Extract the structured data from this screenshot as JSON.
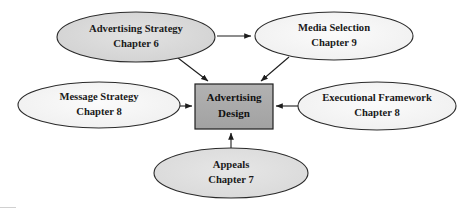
{
  "diagram": {
    "title": "Advertising Design",
    "type": "hub-and-spoke-flow",
    "canvas": {
      "width": 466,
      "height": 208,
      "background": "#ffffff"
    },
    "center": {
      "id": "advertising-design",
      "line1": "Advertising",
      "line2": "Design",
      "shape": "rectangle",
      "fill": "#a9a9a9",
      "stroke": "#1f1f1f",
      "x": 195,
      "y": 84,
      "width": 78,
      "height": 45
    },
    "nodes": [
      {
        "id": "advertising-strategy",
        "line1": "Advertising Strategy",
        "line2": "Chapter 6",
        "shape": "ellipse",
        "fill": "#d6d6d6",
        "stroke": "#2a2a2a",
        "cx": 136,
        "cy": 37,
        "rx": 79,
        "ry": 25
      },
      {
        "id": "media-selection",
        "line1": "Media Selection",
        "line2": "Chapter 9",
        "shape": "ellipse",
        "fill": "#f4f4f4",
        "stroke": "#2a2a2a",
        "cx": 334,
        "cy": 36,
        "rx": 79,
        "ry": 24
      },
      {
        "id": "message-strategy",
        "line1": "Message Strategy",
        "line2": "Chapter 8",
        "shape": "ellipse",
        "fill": "#f2f2f2",
        "stroke": "#2a2a2a",
        "cx": 99,
        "cy": 105,
        "rx": 81,
        "ry": 23
      },
      {
        "id": "executional-framework",
        "line1": "Executional Framework",
        "line2": "Chapter 8",
        "shape": "ellipse",
        "fill": "#f6f6f6",
        "stroke": "#2a2a2a",
        "cx": 377,
        "cy": 106,
        "rx": 79,
        "ry": 24
      },
      {
        "id": "appeals",
        "line1": "Appeals",
        "line2": "Chapter 7",
        "shape": "ellipse",
        "fill": "#dedede",
        "stroke": "#2a2a2a",
        "cx": 231,
        "cy": 173,
        "rx": 77,
        "ry": 25
      }
    ],
    "edges": [
      {
        "id": "strategy-to-media",
        "from": "advertising-strategy",
        "to": "media-selection",
        "direction": "right"
      },
      {
        "id": "strategy-to-design",
        "from": "advertising-strategy",
        "to": "advertising-design",
        "direction": "down-right"
      },
      {
        "id": "media-to-design",
        "from": "media-selection",
        "to": "advertising-design",
        "direction": "down-left"
      },
      {
        "id": "message-to-design",
        "from": "message-strategy",
        "to": "advertising-design",
        "direction": "right"
      },
      {
        "id": "executional-to-design",
        "from": "executional-framework",
        "to": "advertising-design",
        "direction": "left"
      },
      {
        "id": "appeals-to-design",
        "from": "appeals",
        "to": "advertising-design",
        "direction": "up"
      }
    ]
  }
}
